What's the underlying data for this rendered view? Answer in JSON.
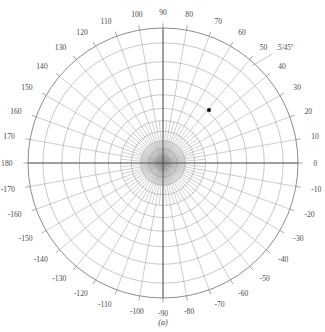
{
  "figure": {
    "caption": "(a)",
    "type": "polar-grid-plot",
    "center_x": 163,
    "center_y": 163,
    "outer_radius": 135,
    "grid_color": "#9a9a9a",
    "axis_color": "#4a4a4a",
    "marker_color": "#000000",
    "background_color": "#ffffff"
  },
  "annotation": {
    "text": ".5/45°",
    "x": 285,
    "y": 50,
    "leader_from_x": 272,
    "leader_from_y": 54,
    "leader_to_x": 252,
    "leader_to_y": 66
  },
  "angle_labels": [
    {
      "text": "0",
      "angle": 0
    },
    {
      "text": "10",
      "angle": 10
    },
    {
      "text": "20",
      "angle": 20
    },
    {
      "text": "30",
      "angle": 30
    },
    {
      "text": "40",
      "angle": 40
    },
    {
      "text": "50",
      "angle": 50
    },
    {
      "text": "60",
      "angle": 60
    },
    {
      "text": "70",
      "angle": 70
    },
    {
      "text": "80",
      "angle": 80
    },
    {
      "text": "90",
      "angle": 90
    },
    {
      "text": "100",
      "angle": 100
    },
    {
      "text": "110",
      "angle": 110
    },
    {
      "text": "120",
      "angle": 120
    },
    {
      "text": "130",
      "angle": 130
    },
    {
      "text": "140",
      "angle": 140
    },
    {
      "text": "150",
      "angle": 150
    },
    {
      "text": "160",
      "angle": 160
    },
    {
      "text": "170",
      "angle": 170
    },
    {
      "text": "180",
      "angle": 180
    },
    {
      "text": "-170",
      "angle": 190
    },
    {
      "text": "-160",
      "angle": 200
    },
    {
      "text": "-150",
      "angle": 210
    },
    {
      "text": "-140",
      "angle": 220
    },
    {
      "text": "-130",
      "angle": 230
    },
    {
      "text": "-120",
      "angle": 240
    },
    {
      "text": "-110",
      "angle": 250
    },
    {
      "text": "-100",
      "angle": 260
    },
    {
      "text": "-90",
      "angle": 270
    },
    {
      "text": "-80",
      "angle": 280
    },
    {
      "text": "-70",
      "angle": 290
    },
    {
      "text": "-60",
      "angle": 300
    },
    {
      "text": "-50",
      "angle": 310
    },
    {
      "text": "-40",
      "angle": 320
    },
    {
      "text": "-30",
      "angle": 330
    },
    {
      "text": "-20",
      "angle": 340
    },
    {
      "text": "-10",
      "angle": 350
    }
  ],
  "chart_data": {
    "type": "scatter",
    "projection": "polar",
    "title": "",
    "subtitle": "",
    "caption": "(a)",
    "xlabel": "",
    "ylabel": "",
    "angular_axis": {
      "label": "",
      "unit": "degrees",
      "range": [
        -180,
        180
      ],
      "tick_step": 10,
      "tick_labels": [
        "0",
        "10",
        "20",
        "30",
        "40",
        "50",
        "60",
        "70",
        "80",
        "90",
        "100",
        "110",
        "120",
        "130",
        "140",
        "150",
        "160",
        "170",
        "180",
        "-170",
        "-160",
        "-150",
        "-140",
        "-130",
        "-120",
        "-110",
        "-100",
        "-90",
        "-80",
        "-70",
        "-60",
        "-50",
        "-40",
        "-30",
        "-20",
        "-10"
      ],
      "zero_location": "east",
      "direction": "counterclockwise"
    },
    "radial_axis": {
      "label": "",
      "tick_labels": [],
      "ring_count": 10,
      "spacing": "nonlinear-compressed-toward-center",
      "normalized_ring_radii": [
        0.055,
        0.105,
        0.165,
        0.235,
        0.315,
        0.405,
        0.505,
        0.62,
        0.75,
        0.89,
        1.0
      ]
    },
    "grid": true,
    "legend": false,
    "legend_position": "none",
    "series": [
      {
        "name": "data point",
        "marker": "square",
        "color": "#000000",
        "points": [
          {
            "angle_deg": 35,
            "radius_normalized": 0.45,
            "px_x": 209,
            "px_y": 110
          }
        ]
      }
    ],
    "annotations": [
      {
        "text": ".5/45°",
        "angle_deg": 45,
        "radius_normalized": 1.02
      }
    ]
  }
}
